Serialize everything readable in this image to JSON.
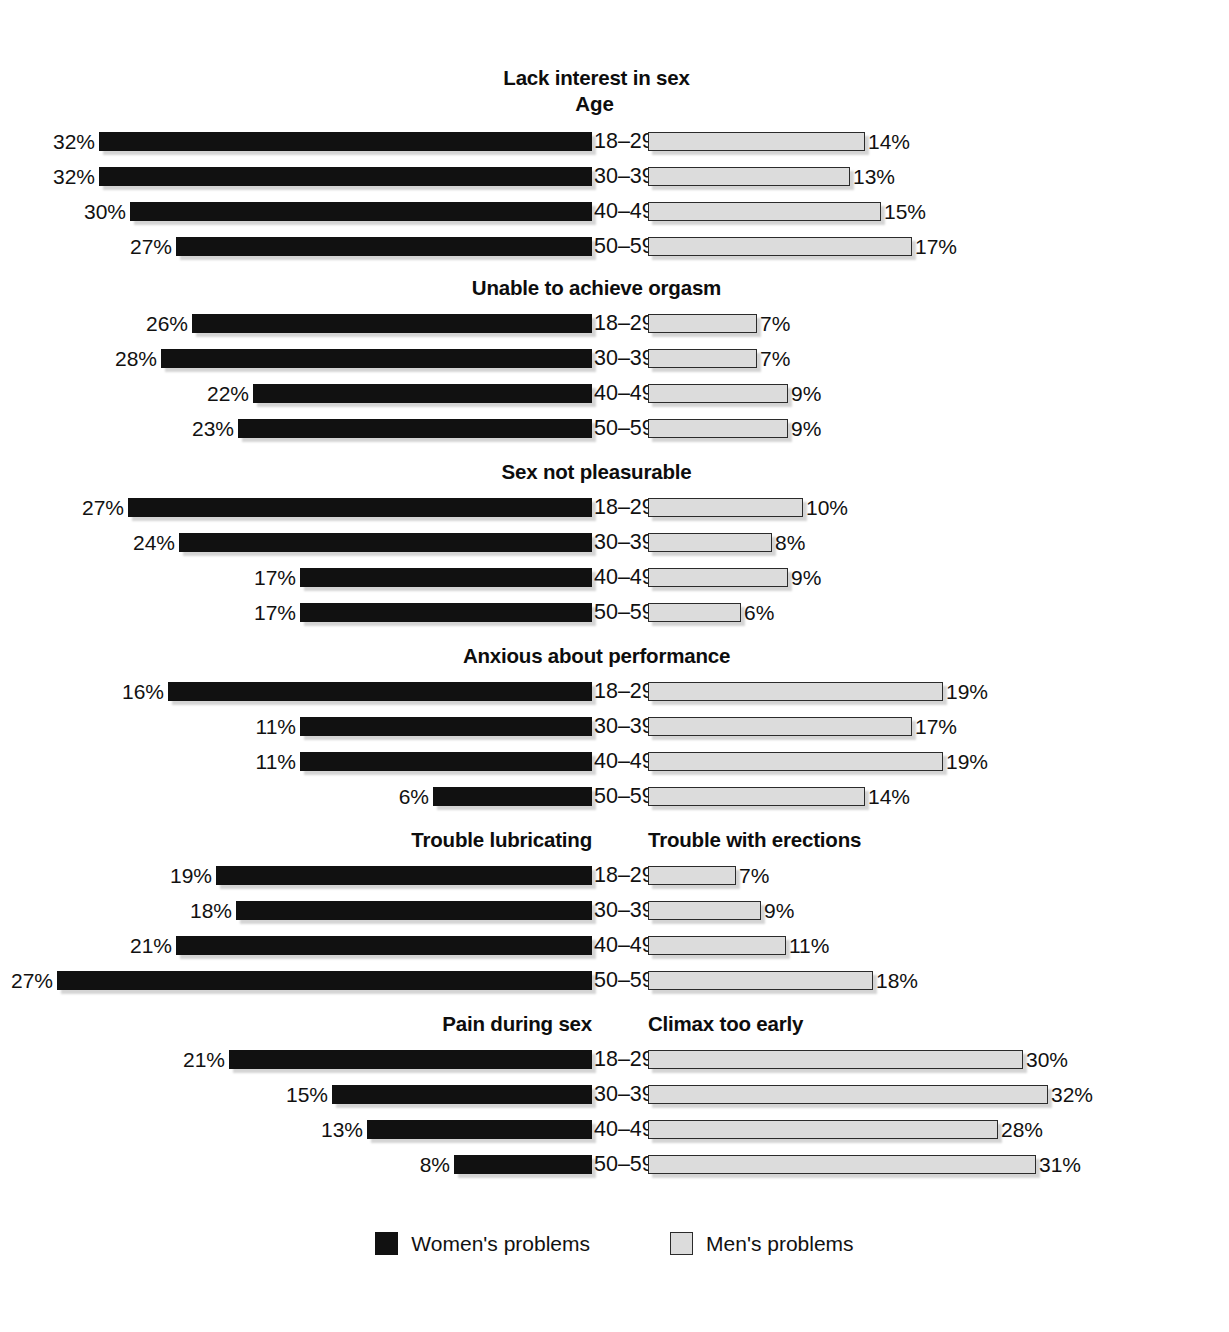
{
  "axis_label": "Age",
  "legend": {
    "women": {
      "label": "Women's problems",
      "color": "#111111"
    },
    "men": {
      "label": "Men's problems",
      "color": "#dcdcdc"
    }
  },
  "chart_data": {
    "type": "bar",
    "title": "",
    "xlabel": "",
    "ylabel": "Age",
    "categories": [
      "18–29",
      "30–39",
      "40–49",
      "50–59"
    ],
    "grid": false,
    "legend_position": "bottom-center",
    "orientation": "horizontal-bidirectional",
    "value_suffix": "%",
    "panels": [
      {
        "left_title": "Lack interest in sex",
        "right_title": "Lack interest in sex",
        "shared_title": true,
        "show_axis_label": true,
        "series": [
          {
            "name": "Women's problems",
            "side": "left",
            "values": [
              32,
              32,
              30,
              27
            ],
            "labels": [
              "32%",
              "32%",
              "30%",
              "27%"
            ]
          },
          {
            "name": "Men's problems",
            "side": "right",
            "values": [
              14,
              13,
              15,
              17
            ],
            "labels": [
              "14%",
              "13%",
              "15%",
              "17%"
            ]
          }
        ]
      },
      {
        "left_title": "Unable to achieve orgasm",
        "right_title": "Unable to achieve orgasm",
        "shared_title": true,
        "show_axis_label": false,
        "series": [
          {
            "name": "Women's problems",
            "side": "left",
            "values": [
              26,
              28,
              22,
              23
            ],
            "labels": [
              "26%",
              "28%",
              "22%",
              "23%"
            ]
          },
          {
            "name": "Men's problems",
            "side": "right",
            "values": [
              7,
              7,
              9,
              9
            ],
            "labels": [
              "7%",
              "7%",
              "9%",
              "9%"
            ]
          }
        ]
      },
      {
        "left_title": "Sex not pleasurable",
        "right_title": "Sex not pleasurable",
        "shared_title": true,
        "show_axis_label": false,
        "series": [
          {
            "name": "Women's problems",
            "side": "left",
            "values": [
              27,
              24,
              17,
              17
            ],
            "labels": [
              "27%",
              "24%",
              "17%",
              "17%"
            ]
          },
          {
            "name": "Men's problems",
            "side": "right",
            "values": [
              10,
              8,
              9,
              6
            ],
            "labels": [
              "10%",
              "8%",
              "9%",
              "6%"
            ]
          }
        ]
      },
      {
        "left_title": "Anxious about performance",
        "right_title": "Anxious about performance",
        "shared_title": true,
        "show_axis_label": false,
        "series": [
          {
            "name": "Women's problems",
            "side": "left",
            "values": [
              16,
              11,
              11,
              6
            ],
            "labels": [
              "16%",
              "11%",
              "11%",
              "6%"
            ]
          },
          {
            "name": "Men's problems",
            "side": "right",
            "values": [
              19,
              17,
              19,
              14
            ],
            "labels": [
              "19%",
              "17%",
              "19%",
              "14%"
            ]
          }
        ]
      },
      {
        "left_title": "Trouble lubricating",
        "right_title": "Trouble with erections",
        "shared_title": false,
        "show_axis_label": false,
        "series": [
          {
            "name": "Women's problems",
            "side": "left",
            "values": [
              19,
              18,
              21,
              27
            ],
            "labels": [
              "19%",
              "18%",
              "21%",
              "27%"
            ]
          },
          {
            "name": "Men's problems",
            "side": "right",
            "values": [
              7,
              9,
              11,
              18
            ],
            "labels": [
              "7%",
              "9%",
              "11%",
              "18%"
            ]
          }
        ]
      },
      {
        "left_title": "Pain during sex",
        "right_title": "Climax too early",
        "shared_title": false,
        "show_axis_label": false,
        "series": [
          {
            "name": "Women's problems",
            "side": "left",
            "values": [
              21,
              15,
              13,
              8
            ],
            "labels": [
              "21%",
              "15%",
              "13%",
              "8%"
            ]
          },
          {
            "name": "Men's problems",
            "side": "right",
            "values": [
              30,
              32,
              28,
              31
            ],
            "labels": [
              "30%",
              "32%",
              "28%",
              "31%"
            ]
          }
        ]
      }
    ]
  },
  "scales": {
    "left_px_per_unit": [
      15.4,
      15.4,
      17.2,
      26.5,
      19.8,
      17.3
    ],
    "right_px_per_unit": [
      15.5,
      15.5,
      15.5,
      15.5,
      12.5,
      12.5
    ],
    "section_top": [
      62,
      272,
      456,
      640,
      824,
      1008
    ]
  }
}
